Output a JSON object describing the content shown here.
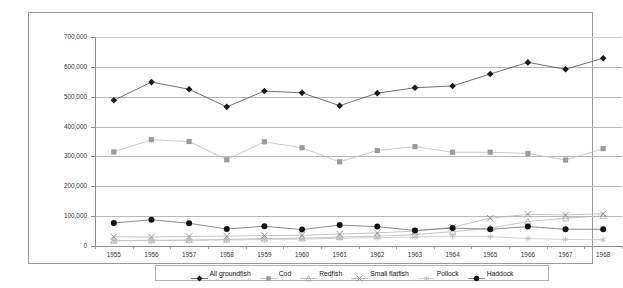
{
  "chart_data": {
    "type": "line",
    "title": "",
    "subtitle": "",
    "xlabel": "",
    "ylabel": "",
    "grid": true,
    "legend_position": "bottom",
    "xlim": [
      1955,
      1968
    ],
    "ylim": [
      0,
      700000
    ],
    "ytick_step": 100000,
    "categories": [
      1955,
      1956,
      1957,
      1958,
      1959,
      1960,
      1961,
      1962,
      1963,
      1964,
      1965,
      1966,
      1967,
      1968
    ],
    "x_tick_labels": [
      "1955",
      "1956",
      "1957",
      "1958",
      "1959",
      "1960",
      "1961",
      "1962",
      "1963",
      "1964",
      "1965",
      "1966",
      "1967",
      "1968"
    ],
    "y_tick_labels": [
      "0",
      "100,000",
      "200,000",
      "300,000",
      "400,000",
      "500,000",
      "600,000",
      "700,000"
    ],
    "y_tick_values": [
      0,
      100000,
      200000,
      300000,
      400000,
      500000,
      600000,
      700000
    ],
    "series": [
      {
        "name": "All groundfish",
        "marker": "diamond",
        "color": "#1a1a1a",
        "line_color": "#4d4d4d",
        "values": [
          488000,
          549000,
          525000,
          466000,
          519000,
          513000,
          470000,
          512000,
          530000,
          536000,
          576000,
          615000,
          592000,
          629000
        ]
      },
      {
        "name": "Cod",
        "marker": "square",
        "color": "#9b9b9b",
        "line_color": "#bdbdbd",
        "values": [
          315000,
          356000,
          350000,
          289000,
          349000,
          329000,
          282000,
          320000,
          333000,
          314000,
          314000,
          310000,
          288000,
          326000
        ]
      },
      {
        "name": "Redfish",
        "marker": "triangle",
        "color": "#a8a8a8",
        "line_color": "#b5b5b5",
        "values": [
          18000,
          19000,
          20000,
          22000,
          25000,
          26000,
          30000,
          33000,
          38000,
          48000,
          60000,
          82000,
          93000,
          101000
        ]
      },
      {
        "name": "Small flatfish",
        "marker": "cross",
        "color": "#8a8a8a",
        "line_color": "#b5b5b5",
        "values": [
          31000,
          30000,
          32000,
          33000,
          35000,
          36000,
          40000,
          44000,
          50000,
          63000,
          93000,
          106000,
          104000,
          108000
        ]
      },
      {
        "name": "Pollock",
        "marker": "star",
        "color": "#b8b8b8",
        "line_color": "#c4c4c4",
        "values": [
          17000,
          18000,
          19000,
          20000,
          22000,
          23000,
          26000,
          28000,
          30000,
          33000,
          31000,
          25000,
          22000,
          21000
        ]
      },
      {
        "name": "Haddock",
        "marker": "circle",
        "color": "#111111",
        "line_color": "#6e6e6e",
        "values": [
          77000,
          88000,
          76000,
          57000,
          66000,
          55000,
          70000,
          65000,
          52000,
          60000,
          56000,
          65000,
          56000,
          56000
        ]
      }
    ]
  },
  "legend": {
    "items": [
      {
        "label": "All groundfish"
      },
      {
        "label": "Cod"
      },
      {
        "label": "Redfish"
      },
      {
        "label": "Small flatfish"
      },
      {
        "label": "Pollock"
      },
      {
        "label": "Haddock"
      }
    ]
  }
}
